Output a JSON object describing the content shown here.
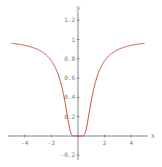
{
  "chart_data": {
    "type": "line",
    "title": "",
    "xlabel": "x",
    "ylabel": "y",
    "xlim": [
      -5.2,
      5.2
    ],
    "ylim": [
      -0.25,
      1.25
    ],
    "grid": false,
    "legend": null,
    "x_ticks": [
      -4,
      -2,
      2,
      4
    ],
    "x_tick_labels": [
      "-4",
      "-2",
      "2",
      "4"
    ],
    "y_ticks": [
      -0.2,
      0.2,
      0.4,
      0.6,
      0.8,
      1,
      1.2
    ],
    "y_tick_labels": [
      "-0.2",
      "0.2",
      "0.4",
      "0.6",
      "0.8",
      "1",
      "1.2"
    ],
    "series": [
      {
        "name": "f(x)",
        "color": "#c0392b",
        "x": [
          -5,
          -4,
          -3,
          -2,
          -1.5,
          -1,
          -0.75,
          -0.5,
          0,
          0.5,
          0.75,
          1,
          1.5,
          2,
          3,
          4,
          5
        ],
        "values": [
          0.96,
          0.94,
          0.89,
          0.78,
          0.64,
          0.37,
          0.17,
          0.02,
          0,
          0.02,
          0.17,
          0.37,
          0.64,
          0.78,
          0.89,
          0.94,
          0.96
        ]
      }
    ],
    "axis_color": "#555555"
  }
}
